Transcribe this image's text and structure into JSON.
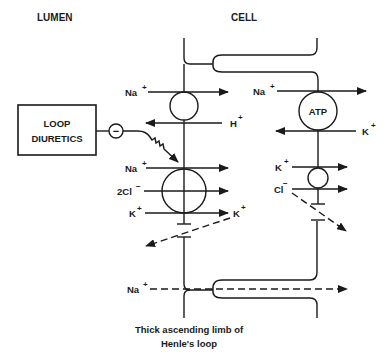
{
  "headers": {
    "lumen": "LUMEN",
    "cell": "CELL"
  },
  "drug_box": {
    "line1": "LOOP",
    "line2": "DIURETICS",
    "inhibition_symbol": "−"
  },
  "apical_membrane": {
    "transporter_1": {
      "in_ion": "Na",
      "in_charge": "+",
      "out_ion": "H",
      "out_charge": "+"
    },
    "transporter_2": {
      "ions": [
        {
          "ion": "Na",
          "charge": "+"
        },
        {
          "ion": "2Cl",
          "charge": "−"
        },
        {
          "ion": "K",
          "charge": "+"
        }
      ],
      "right_label_ion": "K",
      "right_label_charge": "+"
    }
  },
  "basolateral_membrane": {
    "pump": {
      "label": "ATP",
      "in_ion": "Na",
      "in_charge": "+",
      "out_ion": "K",
      "out_charge": "+"
    },
    "cotransporter": {
      "ions": [
        {
          "ion": "K",
          "charge": "+"
        },
        {
          "ion": "Cl",
          "charge": "−"
        }
      ]
    }
  },
  "paracellular": {
    "ion": "Na",
    "charge": "+"
  },
  "caption": {
    "line1": "Thick ascending limb of",
    "line2": "Henle's loop"
  },
  "colors": {
    "ink": "#1a1a1a",
    "background": "#ffffff"
  }
}
